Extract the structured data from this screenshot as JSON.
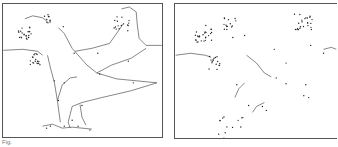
{
  "figure": {
    "caption": "Fig.",
    "panels": [
      {
        "id": "left",
        "description": "Connect-the-dots dinosaur (partially connected)"
      },
      {
        "id": "right",
        "description": "Connect-the-dots puzzle (mostly unconnected dots)"
      }
    ]
  },
  "colors": {
    "line": "#333333",
    "dot": "#222222",
    "border": "#555555"
  }
}
